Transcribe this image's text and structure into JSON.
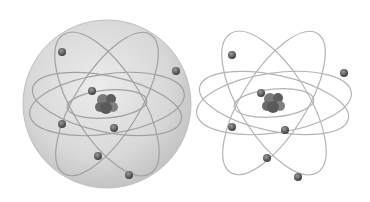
{
  "scene": {
    "description": "Two Bohr-model atom illustrations, one enclosed in a translucent sphere and one without",
    "colors": {
      "background": "#ffffff",
      "sphere": "#d4d4d4",
      "orbit": "#a8a8a8",
      "electron": "#555555",
      "nucleus": "#6a6a6a"
    },
    "atoms": [
      {
        "label": "atom-with-sphere",
        "cx": 107,
        "cy": 104,
        "sphere_radius": 84,
        "electrons": [
          [
            62,
            52
          ],
          [
            176,
            71
          ],
          [
            92,
            91
          ],
          [
            62,
            124
          ],
          [
            114,
            128
          ],
          [
            98,
            156
          ],
          [
            129,
            175
          ]
        ]
      },
      {
        "label": "atom-without-sphere",
        "cx": 274,
        "cy": 103,
        "electrons": [
          [
            232,
            55
          ],
          [
            344,
            73
          ],
          [
            261,
            93
          ],
          [
            232,
            127
          ],
          [
            285,
            130
          ],
          [
            267,
            158
          ],
          [
            298,
            177
          ]
        ]
      }
    ]
  }
}
